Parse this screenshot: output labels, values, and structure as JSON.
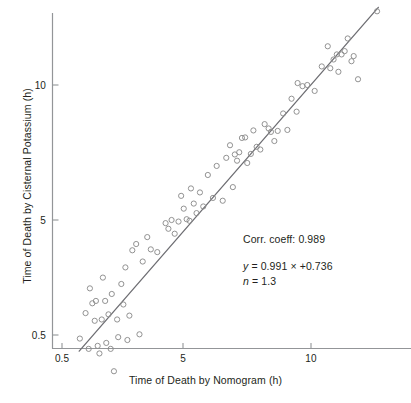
{
  "chart_data": {
    "type": "scatter",
    "title": "",
    "xlabel": "Time of Death by Nomogram (h)",
    "ylabel": "Time of Death by Cisternal Potassium (h)",
    "xscale": "log",
    "yscale": "log",
    "xlim": [
      0.5,
      16.5
    ],
    "ylim": [
      0.5,
      15.5
    ],
    "xticks": [
      0.5,
      5,
      10
    ],
    "xticklabels": [
      "0.5",
      "5",
      "10"
    ],
    "yticks": [
      0.5,
      5,
      10
    ],
    "yticklabels": [
      "0.5",
      "5",
      "10"
    ],
    "grid": false,
    "legend": null,
    "marker": {
      "shape": "open-circle",
      "edge_color": "#8c8c8c",
      "fill": "none",
      "size_px": 5.2
    },
    "fit_line": {
      "color": "#6e6e73",
      "width_px": 1.3,
      "x_start": 2.85,
      "x_end": 14.4,
      "y_start": 2.55,
      "y_end": 14.9
    },
    "points": [
      [
        2.86,
        2.72
      ],
      [
        2.95,
        3.1
      ],
      [
        3.0,
        2.58
      ],
      [
        3.02,
        3.52
      ],
      [
        3.06,
        3.26
      ],
      [
        3.1,
        2.98
      ],
      [
        3.12,
        3.3
      ],
      [
        3.15,
        2.62
      ],
      [
        3.18,
        2.52
      ],
      [
        3.22,
        3.0
      ],
      [
        3.24,
        3.72
      ],
      [
        3.28,
        3.3
      ],
      [
        3.3,
        2.66
      ],
      [
        3.34,
        3.08
      ],
      [
        3.38,
        2.58
      ],
      [
        3.4,
        3.42
      ],
      [
        3.44,
        2.3
      ],
      [
        3.5,
        3.0
      ],
      [
        3.52,
        2.74
      ],
      [
        3.58,
        3.6
      ],
      [
        3.62,
        3.24
      ],
      [
        3.66,
        3.92
      ],
      [
        3.7,
        2.7
      ],
      [
        3.74,
        3.06
      ],
      [
        3.8,
        4.28
      ],
      [
        3.88,
        4.42
      ],
      [
        3.95,
        2.78
      ],
      [
        4.02,
        4.04
      ],
      [
        4.12,
        4.58
      ],
      [
        4.2,
        4.3
      ],
      [
        4.35,
        4.24
      ],
      [
        4.55,
        4.92
      ],
      [
        4.62,
        4.78
      ],
      [
        4.7,
        5.0
      ],
      [
        4.78,
        4.66
      ],
      [
        4.88,
        4.96
      ],
      [
        4.95,
        5.66
      ],
      [
        5.02,
        5.3
      ],
      [
        5.1,
        5.02
      ],
      [
        5.18,
        4.98
      ],
      [
        5.22,
        5.88
      ],
      [
        5.3,
        5.44
      ],
      [
        5.38,
        5.18
      ],
      [
        5.48,
        5.76
      ],
      [
        5.58,
        5.36
      ],
      [
        5.72,
        6.3
      ],
      [
        5.88,
        5.6
      ],
      [
        6.0,
        6.6
      ],
      [
        6.2,
        5.52
      ],
      [
        6.32,
        6.88
      ],
      [
        6.45,
        7.34
      ],
      [
        6.55,
        5.92
      ],
      [
        6.62,
        7.0
      ],
      [
        6.7,
        6.78
      ],
      [
        6.78,
        7.08
      ],
      [
        6.88,
        7.62
      ],
      [
        7.0,
        7.64
      ],
      [
        7.08,
        6.7
      ],
      [
        7.22,
        7.02
      ],
      [
        7.32,
        7.92
      ],
      [
        7.45,
        7.28
      ],
      [
        7.6,
        7.18
      ],
      [
        7.78,
        8.18
      ],
      [
        7.95,
        8.0
      ],
      [
        8.05,
        7.86
      ],
      [
        8.2,
        7.5
      ],
      [
        8.35,
        7.9
      ],
      [
        8.6,
        8.64
      ],
      [
        8.8,
        7.94
      ],
      [
        9.0,
        9.32
      ],
      [
        9.25,
        8.72
      ],
      [
        9.3,
        10.1
      ],
      [
        9.55,
        9.94
      ],
      [
        9.8,
        10.0
      ],
      [
        10.2,
        9.7
      ],
      [
        10.6,
        11.0
      ],
      [
        10.95,
        12.2
      ],
      [
        11.1,
        10.9
      ],
      [
        11.3,
        11.4
      ],
      [
        11.5,
        11.7
      ],
      [
        11.6,
        10.7
      ],
      [
        11.8,
        11.7
      ],
      [
        12.0,
        11.9
      ],
      [
        12.2,
        12.7
      ],
      [
        12.45,
        11.3
      ],
      [
        12.6,
        11.6
      ],
      [
        12.9,
        10.3
      ],
      [
        14.3,
        14.6
      ]
    ]
  },
  "annotations": {
    "corr_coeff": "Corr. coeff: 0.989",
    "equation_var": "y",
    "equation_body": " = 0.991 × +0.736",
    "n_var": "n",
    "n_body": " = 1.3"
  },
  "axes": {
    "x_title": "Time of Death by Nomogram (h)",
    "y_title": "Time of Death by Cisternal Potassium (h)",
    "x_tick_labels": [
      "0.5",
      "5",
      "10"
    ],
    "y_tick_labels": [
      "10",
      "5",
      "0.5"
    ]
  },
  "colors": {
    "axis": "#939598",
    "marker_edge": "#8c8c8c",
    "fit_line": "#6e6e73",
    "text": "#231f20",
    "background": "#ffffff"
  }
}
